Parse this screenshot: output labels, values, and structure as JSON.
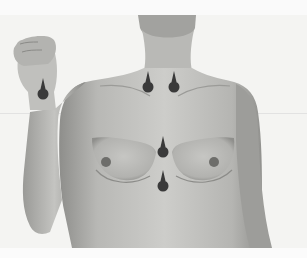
{
  "image": {
    "description": "Grayscale photograph of a female torso, right arm raised with clenched fist, showing anatomical point markers",
    "palette": {
      "background": "#f4f4f2",
      "skin_light": "#c9c9c6",
      "skin_mid": "#a9a9a6",
      "skin_shadow": "#7e7e7b",
      "marker": "#3a3a3a"
    }
  },
  "markers": [
    {
      "name": "wrist-marker",
      "x": 43,
      "y": 95
    },
    {
      "name": "left-clavicle-marker",
      "x": 148,
      "y": 88
    },
    {
      "name": "right-clavicle-marker",
      "x": 174,
      "y": 88
    },
    {
      "name": "mid-sternum-marker",
      "x": 163,
      "y": 153
    },
    {
      "name": "lower-sternum-marker",
      "x": 163,
      "y": 187
    }
  ]
}
